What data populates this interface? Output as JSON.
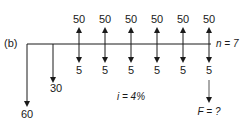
{
  "diagram": {
    "panel_label": "(b)",
    "type": "cash-flow-diagram",
    "periods": [
      0,
      1,
      2,
      3,
      4,
      5,
      6,
      7
    ],
    "n_label": "n = 7",
    "interest_label": "i = 4%",
    "future_value_label": "F = ?",
    "cash_flows": [
      {
        "period": 0,
        "receipt": null,
        "disbursement": "60"
      },
      {
        "period": 1,
        "receipt": null,
        "disbursement": "30"
      },
      {
        "period": 2,
        "receipt": "50",
        "disbursement": "5"
      },
      {
        "period": 3,
        "receipt": "50",
        "disbursement": "5"
      },
      {
        "period": 4,
        "receipt": "50",
        "disbursement": "5"
      },
      {
        "period": 5,
        "receipt": "50",
        "disbursement": "5"
      },
      {
        "period": 6,
        "receipt": "50",
        "disbursement": "5"
      },
      {
        "period": 7,
        "receipt": "50",
        "disbursement": "5"
      }
    ],
    "colors": {
      "line": "#1a1a1a",
      "f_arrow": "#555555"
    }
  }
}
